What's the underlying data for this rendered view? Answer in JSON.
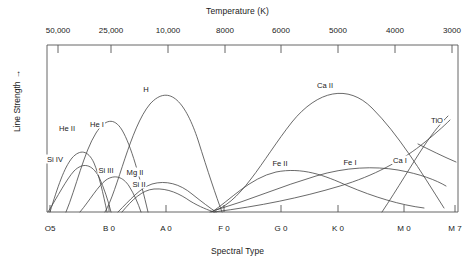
{
  "chart_data": {
    "type": "line",
    "title": "",
    "top_axis": {
      "label": "Temperature (K)",
      "ticks": [
        {
          "text": "50,000",
          "x": 58
        },
        {
          "text": "25,000",
          "x": 111
        },
        {
          "text": "10,000",
          "x": 168
        },
        {
          "text": "8000",
          "x": 225
        },
        {
          "text": "6000",
          "x": 281
        },
        {
          "text": "5000",
          "x": 338
        },
        {
          "text": "4000",
          "x": 395
        },
        {
          "text": "3000",
          "x": 452
        }
      ]
    },
    "bottom_axis": {
      "label": "Spectral Type",
      "ticks": [
        {
          "text": "O5",
          "x": 50
        },
        {
          "text": "B 0",
          "x": 109
        },
        {
          "text": "A 0",
          "x": 166
        },
        {
          "text": "F 0",
          "x": 224
        },
        {
          "text": "G 0",
          "x": 281
        },
        {
          "text": "K 0",
          "x": 338
        },
        {
          "text": "M 0",
          "x": 404
        },
        {
          "text": "M 7",
          "x": 455
        }
      ]
    },
    "ylabel": "Line Strength",
    "ylabel_arrow": "→",
    "grid": false,
    "legend_position": "inline-curve-labels",
    "series": [
      {
        "name": "He II",
        "label_x": 67,
        "label_y": 128,
        "path": "M 50,212 C 58,186 64,168 72,158 C 80,149 88,150 94,163 C 99,175 103,193 107,212"
      },
      {
        "name": "Si IV",
        "label_x": 55,
        "label_y": 159,
        "path": "M 48,212 C 58,196 66,180 74,171 C 83,162 92,164 99,177 C 104,188 108,200 111,212"
      },
      {
        "name": "He I",
        "label_x": 97,
        "label_y": 124,
        "path": "M 66,212 C 76,188 84,152 96,133 C 105,119 114,117 122,130 C 131,145 140,178 148,212"
      },
      {
        "name": "Si III",
        "label_x": 106,
        "label_y": 170,
        "path": "M 80,212 C 90,200 98,186 106,180 C 115,174 123,177 129,186 C 134,194 138,203 141,212"
      },
      {
        "name": "H",
        "label_x": 146,
        "label_y": 89,
        "path": "M 105,212 C 118,190 130,128 150,104 C 170,82 186,104 198,140 C 208,172 216,196 222,212"
      },
      {
        "name": "Mg II",
        "label_x": 135,
        "label_y": 172,
        "path": "M 118,212 C 130,200 140,188 152,184 C 166,180 180,184 192,194 C 202,202 210,208 216,212"
      },
      {
        "name": "Si II",
        "label_x": 139,
        "label_y": 184,
        "path": "M 122,212 C 132,200 142,190 154,189 C 168,188 180,194 190,201 C 200,207 208,210 214,212"
      },
      {
        "name": "Ca II",
        "label_x": 325,
        "label_y": 85,
        "path": "M 210,212 C 240,206 262,160 292,122 C 318,90 348,84 372,108 C 398,134 420,170 444,208"
      },
      {
        "name": "Fe II",
        "label_x": 280,
        "label_y": 163,
        "path": "M 212,212 C 230,200 250,178 276,172 C 302,167 324,175 348,186 C 374,197 400,205 424,208"
      },
      {
        "name": "Fe I",
        "label_x": 350,
        "label_y": 162,
        "path": "M 216,210 C 250,200 282,186 316,176 C 346,167 374,166 398,170 C 420,174 436,180 446,186"
      },
      {
        "name": "Ca I",
        "label_x": 400,
        "label_y": 160,
        "path": "M 214,212 C 260,206 300,198 340,186 C 374,176 402,160 420,146 C 434,135 444,126 450,120"
      },
      {
        "name": "TiO",
        "label_x": 437,
        "label_y": 120,
        "path": "M 382,212 C 398,188 412,164 424,146 C 434,131 442,122 448,116"
      },
      {
        "name": "TiO-branch",
        "label_x": -100,
        "label_y": -100,
        "path": "M 418,144 C 430,150 442,156 456,162"
      }
    ]
  }
}
